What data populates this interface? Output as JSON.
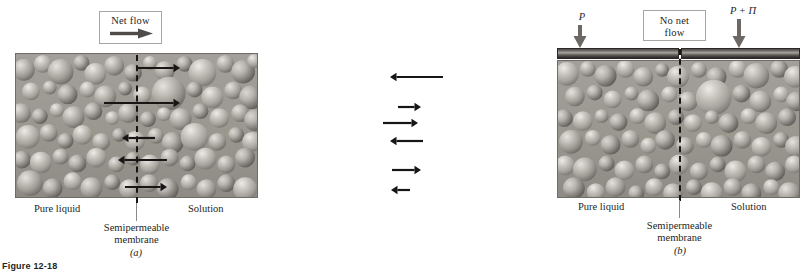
{
  "figure": {
    "number_label": "Figure 12-18",
    "accent_dark": "#231f1e",
    "arrow_color": "#181615",
    "pressure_arrow_color": "#6b6865",
    "membrane_color": "#181615",
    "vessel_border": "#6e6b68",
    "piston_color": "#4a4744"
  },
  "panels": [
    {
      "id": "a",
      "subfigure_label": "(a)",
      "callout": {
        "label": "Net flow",
        "arrow_icon": "right-arrow-icon",
        "arrow_direction": "right"
      },
      "left_region_label": "Pure liquid",
      "right_region_label": "Solution",
      "membrane_label": "Semipermeable\nmembrane",
      "pressures": [],
      "flow_arrows": [
        {
          "direction": "right",
          "y": 68,
          "x_start": 136,
          "x_end": 180,
          "note": "solvent crosses to solution"
        },
        {
          "direction": "right",
          "y": 103,
          "x_start": 104,
          "x_end": 180,
          "note": "solvent crosses to solution"
        },
        {
          "direction": "left",
          "y": 138,
          "x_start": 155,
          "x_end": 122,
          "note": "shorter reverse arrow"
        },
        {
          "direction": "left",
          "y": 160,
          "x_start": 167,
          "x_end": 118,
          "note": "reverse arrow"
        },
        {
          "direction": "right",
          "y": 187,
          "x_start": 125,
          "x_end": 167,
          "note": "short forward arrow"
        }
      ]
    },
    {
      "id": "b",
      "subfigure_label": "(b)",
      "callout": {
        "label": "No net\nflow",
        "arrow_icon": "none",
        "arrow_direction": "none"
      },
      "left_region_label": "Pure liquid",
      "right_region_label": "Solution",
      "membrane_label": "Semipermeable\nmembrane",
      "pressures": [
        {
          "symbol": "P",
          "side": "left",
          "arrow_icon": "down-arrow-icon"
        },
        {
          "symbol": "P + Π",
          "side": "right",
          "arrow_icon": "down-arrow-icon"
        }
      ],
      "flow_arrows": [
        {
          "direction": "left",
          "y": 77,
          "x_start": 443,
          "x_end": 390,
          "note": "solvent returns"
        },
        {
          "direction": "right",
          "y": 107,
          "x_start": 398,
          "x_end": 421,
          "note": "short forward"
        },
        {
          "direction": "right",
          "y": 123,
          "x_start": 383,
          "x_end": 418,
          "note": "forward"
        },
        {
          "direction": "left",
          "y": 141,
          "x_start": 423,
          "x_end": 390,
          "note": "reverse"
        },
        {
          "direction": "right",
          "y": 170,
          "x_start": 392,
          "x_end": 421,
          "note": "forward"
        },
        {
          "direction": "left",
          "y": 190,
          "x_start": 410,
          "x_end": 391,
          "note": "short reverse"
        }
      ]
    }
  ]
}
